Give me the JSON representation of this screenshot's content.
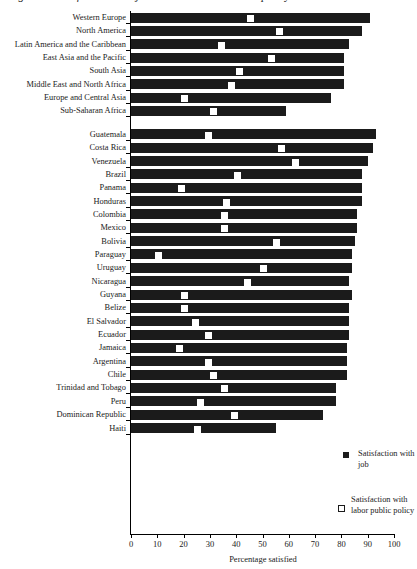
{
  "chart_data": {
    "type": "bar",
    "title": "Figure 1. Satisfaction with job and with labor market policy",
    "xlabel": "Percentage satisfied",
    "ylabel": "",
    "xlim": [
      0,
      100
    ],
    "grid": false,
    "legend_position": "right-bottom",
    "tick_labels": [
      "0",
      "10",
      "20",
      "30",
      "40",
      "50",
      "60",
      "70",
      "80",
      "90",
      "100"
    ],
    "tick_values": [
      0,
      10,
      20,
      30,
      40,
      50,
      60,
      70,
      80,
      90,
      100
    ],
    "series": [
      {
        "name": "Satisfaction with job",
        "marker": "filled-square"
      },
      {
        "name": "Satisfaction with labor public policy",
        "marker": "open-square"
      }
    ],
    "groups": [
      {
        "name": "regions",
        "categories": [
          "Western Europe",
          "North America",
          "Latin America and the Caribbean",
          "East Asia and the Pacific",
          "South Asia",
          "Middle East and North Africa",
          "Europe and Central Asia",
          "Sub-Saharan Africa"
        ],
        "job": [
          91,
          88,
          83,
          81,
          81,
          81,
          76,
          59
        ],
        "policy": [
          45,
          56,
          34,
          53,
          41,
          38,
          20,
          31
        ]
      },
      {
        "name": "countries",
        "categories": [
          "Guatemala",
          "Costa Rica",
          "Venezuela",
          "Brazil",
          "Panama",
          "Honduras",
          "Colombia",
          "Mexico",
          "Bolivia",
          "Paraguay",
          "Uruguay",
          "Nicaragua",
          "Guyana",
          "Belize",
          "El Salvador",
          "Ecuador",
          "Jamaica",
          "Argentina",
          "Chile",
          "Trinidad and Tobago",
          "Peru",
          "Dominican Republic",
          "Haiti"
        ],
        "job": [
          93,
          92,
          90,
          88,
          88,
          88,
          86,
          86,
          85,
          84,
          84,
          83,
          84,
          83,
          83,
          83,
          82,
          82,
          82,
          78,
          78,
          73,
          55
        ],
        "policy": [
          29,
          57,
          62,
          40,
          19,
          36,
          35,
          35,
          55,
          10,
          50,
          44,
          20,
          20,
          24,
          29,
          18,
          29,
          31,
          35,
          26,
          39,
          25
        ]
      }
    ]
  },
  "legend": {
    "job_label": "Satisfaction with job",
    "policy_label": "Satisfaction with labor public policy"
  }
}
